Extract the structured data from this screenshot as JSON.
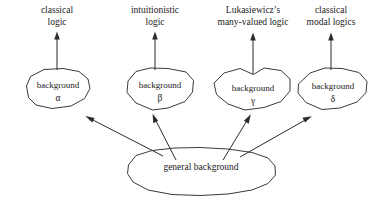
{
  "diagram": {
    "stroke_color": "#3a3a3a",
    "arrow_color": "#2b2b2b",
    "background_color": "#ffffff",
    "systems": [
      {
        "id": "classical-logic",
        "label_line1": "classical",
        "label_line2": "logic",
        "background_word": "background",
        "greek": "α"
      },
      {
        "id": "intuitionistic-logic",
        "label_line1": "intuitionistic",
        "label_line2": "logic",
        "background_word": "background",
        "greek": "β"
      },
      {
        "id": "lukasiewicz-many-valued-logic",
        "label_line1": "Lukasiewicz’s",
        "label_line2": "many-valued logic",
        "background_word": "background",
        "greek": "γ"
      },
      {
        "id": "classical-modal-logics",
        "label_line1": "classical",
        "label_line2": "modal logics",
        "background_word": "background",
        "greek": "δ"
      }
    ],
    "general_background": {
      "label": "general background"
    }
  }
}
